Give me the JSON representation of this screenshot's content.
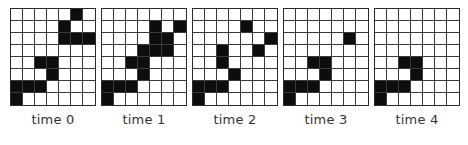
{
  "grid": {
    "rows": 8,
    "cols": 7,
    "on_color": "#0d0d0d",
    "off_color": "#ffffff",
    "line_color": "#3a3a3a"
  },
  "panels": [
    {
      "label": "time 0",
      "left": 10,
      "cells": [
        [
          0,
          5
        ],
        [
          1,
          4
        ],
        [
          2,
          4
        ],
        [
          2,
          5
        ],
        [
          2,
          6
        ],
        [
          4,
          2
        ],
        [
          4,
          3
        ],
        [
          5,
          3
        ],
        [
          6,
          0
        ],
        [
          6,
          1
        ],
        [
          6,
          2
        ],
        [
          7,
          0
        ]
      ]
    },
    {
      "label": "time 1",
      "left": 101,
      "cells": [
        [
          1,
          4
        ],
        [
          1,
          6
        ],
        [
          2,
          4
        ],
        [
          2,
          5
        ],
        [
          3,
          3
        ],
        [
          3,
          4
        ],
        [
          3,
          5
        ],
        [
          4,
          2
        ],
        [
          4,
          3
        ],
        [
          5,
          3
        ],
        [
          6,
          0
        ],
        [
          6,
          1
        ],
        [
          6,
          2
        ],
        [
          7,
          0
        ]
      ]
    },
    {
      "label": "time 2",
      "left": 192,
      "cells": [
        [
          1,
          4
        ],
        [
          2,
          6
        ],
        [
          3,
          2
        ],
        [
          3,
          5
        ],
        [
          4,
          2
        ],
        [
          5,
          3
        ],
        [
          6,
          0
        ],
        [
          6,
          1
        ],
        [
          6,
          2
        ],
        [
          7,
          0
        ]
      ]
    },
    {
      "label": "time 3",
      "left": 283,
      "cells": [
        [
          2,
          5
        ],
        [
          4,
          2
        ],
        [
          4,
          3
        ],
        [
          5,
          3
        ],
        [
          6,
          0
        ],
        [
          6,
          1
        ],
        [
          6,
          2
        ],
        [
          7,
          0
        ]
      ]
    },
    {
      "label": "time 4",
      "left": 374,
      "cells": [
        [
          4,
          2
        ],
        [
          4,
          3
        ],
        [
          5,
          3
        ],
        [
          6,
          0
        ],
        [
          6,
          1
        ],
        [
          6,
          2
        ],
        [
          7,
          0
        ]
      ]
    }
  ]
}
